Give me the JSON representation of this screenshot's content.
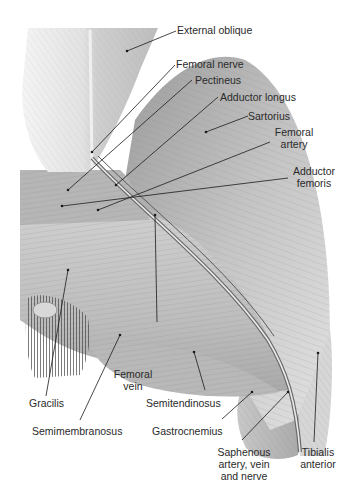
{
  "figure": {
    "labels": {
      "external_oblique": "External oblique",
      "femoral_nerve": "Femoral nerve",
      "pectineus": "Pectineus",
      "adductor_longus": "Adductor longus",
      "sartorius": "Sartorius",
      "femoral_artery_1": "Femoral",
      "femoral_artery_2": "artery",
      "adductor_femoris_1": "Adductor",
      "adductor_femoris_2": "femoris",
      "femoral_vein_1": "Femoral",
      "femoral_vein_2": "vein",
      "gracilis": "Gracilis",
      "semitendinosus": "Semitendinosus",
      "semimembranosus": "Semimembranosus",
      "gastrocnemius": "Gastrocnemius",
      "saphenous_1": "Saphenous",
      "saphenous_2": "artery, vein",
      "saphenous_3": "and nerve",
      "tibialis_1": "Tibialis",
      "tibialis_2": "anterior"
    }
  }
}
